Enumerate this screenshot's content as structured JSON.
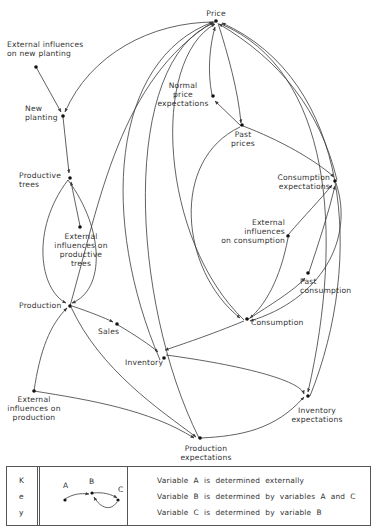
{
  "diagram": {
    "type": "causal-loop-diagram",
    "nodes": {
      "price": "Price",
      "ext_new_planting": "External influences\non new planting",
      "new_planting": "New\nplanting",
      "normal_price_expectations": "Normal\nprice\nexpectations",
      "past_prices": "Past\nprices",
      "productive_trees": "Productive\ntrees",
      "consumption_expectations": "Consumption\nexpectations",
      "ext_productive_trees": "External\ninfluences on\nproductive\ntrees",
      "ext_consumption": "External\ninfluences\non consumption",
      "past_consumption": "Past\nconsumption",
      "production": "Production",
      "sales": "Sales",
      "consumption": "Consumption",
      "inventory": "Inventory",
      "ext_production": "External\ninfluences on\nproduction",
      "production_expectations": "Production\nexpectations",
      "inventory_expectations": "Inventory\nexpectations"
    },
    "edges": [
      {
        "from": "External influences on new planting",
        "to": "New planting"
      },
      {
        "from": "Price",
        "to": "New planting"
      },
      {
        "from": "New planting",
        "to": "Productive trees"
      },
      {
        "from": "External influences on productive trees",
        "to": "Productive trees"
      },
      {
        "from": "Productive trees",
        "to": "Production"
      },
      {
        "from": "External influences on production",
        "to": "Production"
      },
      {
        "from": "External influences on production",
        "to": "Production expectations"
      },
      {
        "from": "Production",
        "to": "Sales"
      },
      {
        "from": "Sales",
        "to": "Inventory"
      },
      {
        "from": "Production",
        "to": "Production expectations"
      },
      {
        "from": "Production",
        "to": "Price"
      },
      {
        "from": "Inventory",
        "to": "Price"
      },
      {
        "from": "Production expectations",
        "to": "Price"
      },
      {
        "from": "Consumption",
        "to": "Price"
      },
      {
        "from": "Price",
        "to": "Past prices"
      },
      {
        "from": "Past prices",
        "to": "Normal price expectations"
      },
      {
        "from": "Normal price expectations",
        "to": "Price"
      },
      {
        "from": "Past prices",
        "to": "Consumption expectations"
      },
      {
        "from": "Past prices",
        "to": "Consumption"
      },
      {
        "from": "External influences on consumption",
        "to": "Consumption expectations"
      },
      {
        "from": "External influences on consumption",
        "to": "Consumption"
      },
      {
        "from": "Past consumption",
        "to": "Consumption expectations"
      },
      {
        "from": "Consumption",
        "to": "Past consumption"
      },
      {
        "from": "Consumption expectations",
        "to": "Consumption"
      },
      {
        "from": "Consumption expectations",
        "to": "Price"
      },
      {
        "from": "Consumption",
        "to": "Inventory"
      },
      {
        "from": "Inventory",
        "to": "Inventory expectations"
      },
      {
        "from": "Production expectations",
        "to": "Inventory expectations"
      },
      {
        "from": "Consumption expectations",
        "to": "Inventory expectations"
      },
      {
        "from": "Price",
        "to": "Inventory expectations"
      },
      {
        "from": "Inventory expectations",
        "to": "Price"
      }
    ]
  },
  "key": {
    "title_letters": [
      "K",
      "e",
      "y"
    ],
    "example_nodes": [
      "A",
      "B",
      "C"
    ],
    "lines": [
      "Variable  A  is  determined  externally",
      "Variable  B  is  determined  by  variables  A  and  C",
      "Variable  C  is  determined  by  variable  B"
    ]
  },
  "colors": {
    "line": "#3a3a3a",
    "text": "#333333",
    "background": "#ffffff"
  }
}
